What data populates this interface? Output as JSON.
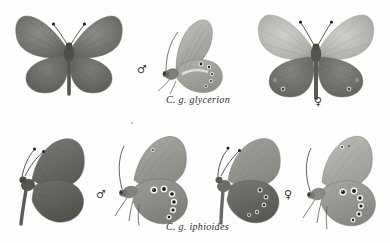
{
  "plate": {
    "background_color": "#ffffff",
    "kind": "taxonomic-specimen-plate",
    "subject": "Coenonympha glycerion subspecies"
  },
  "captions": [
    {
      "id": "caption-glycerion",
      "text": "C. g. glycerion",
      "row": "top"
    },
    {
      "id": "caption-iphioides",
      "text": "C. g. iphioides",
      "row": "bottom"
    }
  ],
  "symbols": {
    "male": "♂",
    "female": "♀",
    "male_name": "male-symbol",
    "female_name": "female-symbol"
  },
  "colors": {
    "wing_dark": "#6a6968",
    "wing_mid": "#8d8c89",
    "wing_light": "#b9b8b4",
    "wing_pale": "#d2d1cd",
    "body_dark": "#55544f",
    "vein": "#5a5954",
    "eyespot_ring": "#f2f1ec",
    "eyespot_core": "#1a1a18",
    "outline": "#77766f",
    "caption_text": "#2b2b2b"
  },
  "specimens": [
    {
      "id": "specimen-1",
      "name": "glycerion-male-dorsal",
      "row": "top",
      "sex": "♂",
      "view": "dorsal",
      "pose": "spread-wings",
      "subspecies": "C. g. glycerion",
      "eyespots": 0,
      "tone": "uniform grey-brown, darker hindwings"
    },
    {
      "id": "specimen-2",
      "name": "glycerion-male-ventral",
      "row": "top",
      "sex": "♂",
      "view": "ventral",
      "pose": "side-closed-wings",
      "subspecies": "C. g. glycerion",
      "eyespots": 5,
      "tone": "pale grey underside with small faint ocelli and white patch"
    },
    {
      "id": "specimen-3",
      "name": "glycerion-female-dorsal",
      "row": "top",
      "sex": "♀",
      "view": "dorsal",
      "pose": "spread-wings",
      "subspecies": "C. g. glycerion",
      "eyespots": 4,
      "tone": "pale forewings, dark hindwings with faint marginal ocelli"
    },
    {
      "id": "specimen-4",
      "name": "iphioides-male-dorsal",
      "row": "bottom",
      "sex": "♂",
      "view": "dorsal",
      "pose": "half-spread",
      "subspecies": "C. g. iphioides",
      "eyespots": 0,
      "tone": "dark grey-brown, plain above"
    },
    {
      "id": "specimen-5",
      "name": "iphioides-male-ventral",
      "row": "bottom",
      "sex": "♂",
      "view": "ventral",
      "pose": "side-closed-wings",
      "subspecies": "C. g. iphioides",
      "eyespots": 6,
      "tone": "grey underside with large white-ringed black ocelli"
    },
    {
      "id": "specimen-6",
      "name": "iphioides-female-dorsal",
      "row": "bottom",
      "sex": "♀",
      "view": "dorsal",
      "pose": "half-spread",
      "subspecies": "C. g. iphioides",
      "eyespots": 5,
      "tone": "dark hindwing with row of small ringed ocelli"
    },
    {
      "id": "specimen-7",
      "name": "iphioides-female-ventral",
      "row": "bottom",
      "sex": "♀",
      "view": "ventral",
      "pose": "side-closed-wings",
      "subspecies": "C. g. iphioides",
      "eyespots": 6,
      "tone": "pale grey underside with bold white-ringed ocelli"
    }
  ]
}
